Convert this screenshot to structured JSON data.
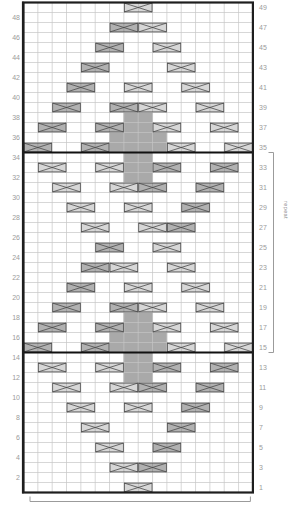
{
  "chart": {
    "columns": 16,
    "rows": 49,
    "origin": {
      "x": 23.5,
      "y": 2.5
    },
    "cell": {
      "w": 14.3375,
      "h": 10
    },
    "colors": {
      "grid_line": "#c6c6c6",
      "grid_border": "#1e1e1e",
      "bold_line": "#111111",
      "cable_light": "#d7d7d7",
      "cable_dark": "#b1b1b1",
      "cable_stroke": "#4a4a4a",
      "shaded_cell": "#a9a9a9",
      "shaded_cell_line": "#9b9b9b",
      "label": "#9b9b9b",
      "bracket": "#9b9b9b"
    },
    "left_labels": [
      48,
      46,
      44,
      42,
      40,
      38,
      36,
      34,
      32,
      30,
      28,
      26,
      24,
      22,
      20,
      18,
      16,
      14,
      12,
      10,
      8,
      6,
      4,
      2
    ],
    "right_labels": [
      49,
      47,
      45,
      43,
      41,
      39,
      37,
      35,
      33,
      31,
      29,
      27,
      25,
      23,
      21,
      19,
      17,
      15,
      13,
      11,
      9,
      7,
      5,
      3,
      1
    ],
    "bold_lines_below_rows": [
      35,
      15
    ],
    "repeat_bracket": {
      "from_row": 35,
      "to_row": 15
    },
    "repeat_note": "repeat",
    "shaded_cells": [
      {
        "r": 38,
        "c1": 8,
        "c2": 9
      },
      {
        "r": 37,
        "c1": 8,
        "c2": 9
      },
      {
        "r": 36,
        "c1": 7,
        "c2": 10
      },
      {
        "r": 35,
        "c1": 7,
        "c2": 10
      },
      {
        "r": 34,
        "c1": 8,
        "c2": 9
      },
      {
        "r": 33,
        "c1": 8,
        "c2": 9
      },
      {
        "r": 32,
        "c1": 8,
        "c2": 9
      },
      {
        "r": 18,
        "c1": 8,
        "c2": 9
      },
      {
        "r": 17,
        "c1": 8,
        "c2": 9
      },
      {
        "r": 16,
        "c1": 7,
        "c2": 10
      },
      {
        "r": 15,
        "c1": 7,
        "c2": 10
      },
      {
        "r": 14,
        "c1": 8,
        "c2": 9
      },
      {
        "r": 13,
        "c1": 8,
        "c2": 9
      },
      {
        "r": 12,
        "c1": 8,
        "c2": 9
      }
    ],
    "cables": [
      {
        "r": 49,
        "c": 8,
        "t": "L"
      },
      {
        "r": 47,
        "c": 7,
        "t": "D"
      },
      {
        "r": 47,
        "c": 9,
        "t": "L"
      },
      {
        "r": 45,
        "c": 6,
        "t": "D"
      },
      {
        "r": 45,
        "c": 10,
        "t": "L"
      },
      {
        "r": 43,
        "c": 5,
        "t": "D"
      },
      {
        "r": 43,
        "c": 11,
        "t": "L"
      },
      {
        "r": 41,
        "c": 4,
        "t": "D"
      },
      {
        "r": 41,
        "c": 8,
        "t": "L"
      },
      {
        "r": 41,
        "c": 12,
        "t": "L"
      },
      {
        "r": 39,
        "c": 3,
        "t": "D"
      },
      {
        "r": 39,
        "c": 7,
        "t": "D"
      },
      {
        "r": 39,
        "c": 9,
        "t": "L"
      },
      {
        "r": 39,
        "c": 13,
        "t": "L"
      },
      {
        "r": 37,
        "c": 2,
        "t": "D"
      },
      {
        "r": 37,
        "c": 6,
        "t": "D"
      },
      {
        "r": 37,
        "c": 10,
        "t": "L"
      },
      {
        "r": 37,
        "c": 14,
        "t": "L"
      },
      {
        "r": 35,
        "c": 1,
        "t": "D"
      },
      {
        "r": 35,
        "c": 5,
        "t": "D"
      },
      {
        "r": 35,
        "c": 11,
        "t": "L"
      },
      {
        "r": 35,
        "c": 15,
        "t": "L"
      },
      {
        "r": 33,
        "c": 2,
        "t": "L"
      },
      {
        "r": 33,
        "c": 6,
        "t": "L"
      },
      {
        "r": 33,
        "c": 10,
        "t": "D"
      },
      {
        "r": 33,
        "c": 14,
        "t": "D"
      },
      {
        "r": 31,
        "c": 3,
        "t": "L"
      },
      {
        "r": 31,
        "c": 7,
        "t": "L"
      },
      {
        "r": 31,
        "c": 9,
        "t": "D"
      },
      {
        "r": 31,
        "c": 13,
        "t": "D"
      },
      {
        "r": 29,
        "c": 4,
        "t": "L"
      },
      {
        "r": 29,
        "c": 8,
        "t": "L"
      },
      {
        "r": 29,
        "c": 12,
        "t": "D"
      },
      {
        "r": 27,
        "c": 5,
        "t": "L"
      },
      {
        "r": 27,
        "c": 9,
        "t": "L"
      },
      {
        "r": 27,
        "c": 11,
        "t": "D"
      },
      {
        "r": 25,
        "c": 6,
        "t": "D"
      },
      {
        "r": 25,
        "c": 10,
        "t": "L"
      },
      {
        "r": 23,
        "c": 5,
        "t": "D"
      },
      {
        "r": 23,
        "c": 7,
        "t": "L"
      },
      {
        "r": 23,
        "c": 11,
        "t": "L"
      },
      {
        "r": 21,
        "c": 4,
        "t": "D"
      },
      {
        "r": 21,
        "c": 8,
        "t": "L"
      },
      {
        "r": 21,
        "c": 12,
        "t": "L"
      },
      {
        "r": 19,
        "c": 3,
        "t": "D"
      },
      {
        "r": 19,
        "c": 7,
        "t": "D"
      },
      {
        "r": 19,
        "c": 9,
        "t": "L"
      },
      {
        "r": 19,
        "c": 13,
        "t": "L"
      },
      {
        "r": 17,
        "c": 2,
        "t": "D"
      },
      {
        "r": 17,
        "c": 6,
        "t": "D"
      },
      {
        "r": 17,
        "c": 10,
        "t": "L"
      },
      {
        "r": 17,
        "c": 14,
        "t": "L"
      },
      {
        "r": 15,
        "c": 1,
        "t": "D"
      },
      {
        "r": 15,
        "c": 5,
        "t": "D"
      },
      {
        "r": 15,
        "c": 11,
        "t": "L"
      },
      {
        "r": 15,
        "c": 15,
        "t": "L"
      },
      {
        "r": 13,
        "c": 2,
        "t": "L"
      },
      {
        "r": 13,
        "c": 6,
        "t": "L"
      },
      {
        "r": 13,
        "c": 10,
        "t": "D"
      },
      {
        "r": 13,
        "c": 14,
        "t": "D"
      },
      {
        "r": 11,
        "c": 3,
        "t": "L"
      },
      {
        "r": 11,
        "c": 7,
        "t": "L"
      },
      {
        "r": 11,
        "c": 9,
        "t": "D"
      },
      {
        "r": 11,
        "c": 13,
        "t": "D"
      },
      {
        "r": 9,
        "c": 4,
        "t": "L"
      },
      {
        "r": 9,
        "c": 8,
        "t": "L"
      },
      {
        "r": 9,
        "c": 12,
        "t": "D"
      },
      {
        "r": 7,
        "c": 5,
        "t": "L"
      },
      {
        "r": 7,
        "c": 11,
        "t": "D"
      },
      {
        "r": 5,
        "c": 6,
        "t": "L"
      },
      {
        "r": 5,
        "c": 10,
        "t": "D"
      },
      {
        "r": 3,
        "c": 7,
        "t": "L"
      },
      {
        "r": 3,
        "c": 9,
        "t": "D"
      },
      {
        "r": 1,
        "c": 8,
        "t": "L"
      }
    ]
  }
}
